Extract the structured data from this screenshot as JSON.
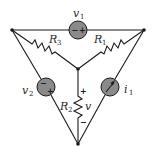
{
  "diagram": {
    "type": "circuit",
    "topology": "triangle (delta) of sources with wye of resistors to center node",
    "nodes": {
      "top_left": "node",
      "top_right": "node",
      "bottom": "node",
      "center": "node"
    },
    "components": [
      {
        "id": "v1",
        "kind": "voltage-source",
        "label": "v",
        "sub": "1",
        "between": [
          "top_left",
          "top_right"
        ],
        "polarity": [
          "−",
          "+"
        ]
      },
      {
        "id": "v2",
        "kind": "voltage-source",
        "label": "v",
        "sub": "2",
        "between": [
          "top_left",
          "bottom"
        ],
        "polarity": [
          "−",
          "+"
        ]
      },
      {
        "id": "i1",
        "kind": "current-source",
        "label": "i",
        "sub": "1",
        "between": [
          "bottom",
          "top_right"
        ],
        "direction": "toward top_right"
      },
      {
        "id": "R1",
        "kind": "resistor",
        "label": "R",
        "sub": "1",
        "between": [
          "top_right",
          "center"
        ]
      },
      {
        "id": "R2",
        "kind": "resistor",
        "label": "R",
        "sub": "2",
        "between": [
          "center",
          "bottom"
        ],
        "voltage_label": "v",
        "polarity": [
          "+",
          "−"
        ]
      },
      {
        "id": "R3",
        "kind": "resistor",
        "label": "R",
        "sub": "3",
        "between": [
          "top_left",
          "center"
        ]
      }
    ],
    "labels": {
      "v1_main": "v",
      "v1_sub": "1",
      "v2_main": "v",
      "v2_sub": "2",
      "i1_main": "i",
      "i1_sub": "1",
      "r1_main": "R",
      "r1_sub": "1",
      "r2_main": "R",
      "r2_sub": "2",
      "r3_main": "R",
      "r3_sub": "3",
      "v_main": "v",
      "plus": "+",
      "minus": "−"
    },
    "colors": {
      "wire": "#1a1a1a",
      "source_fill": "#8a8a8a",
      "background": "#ffffff"
    }
  }
}
